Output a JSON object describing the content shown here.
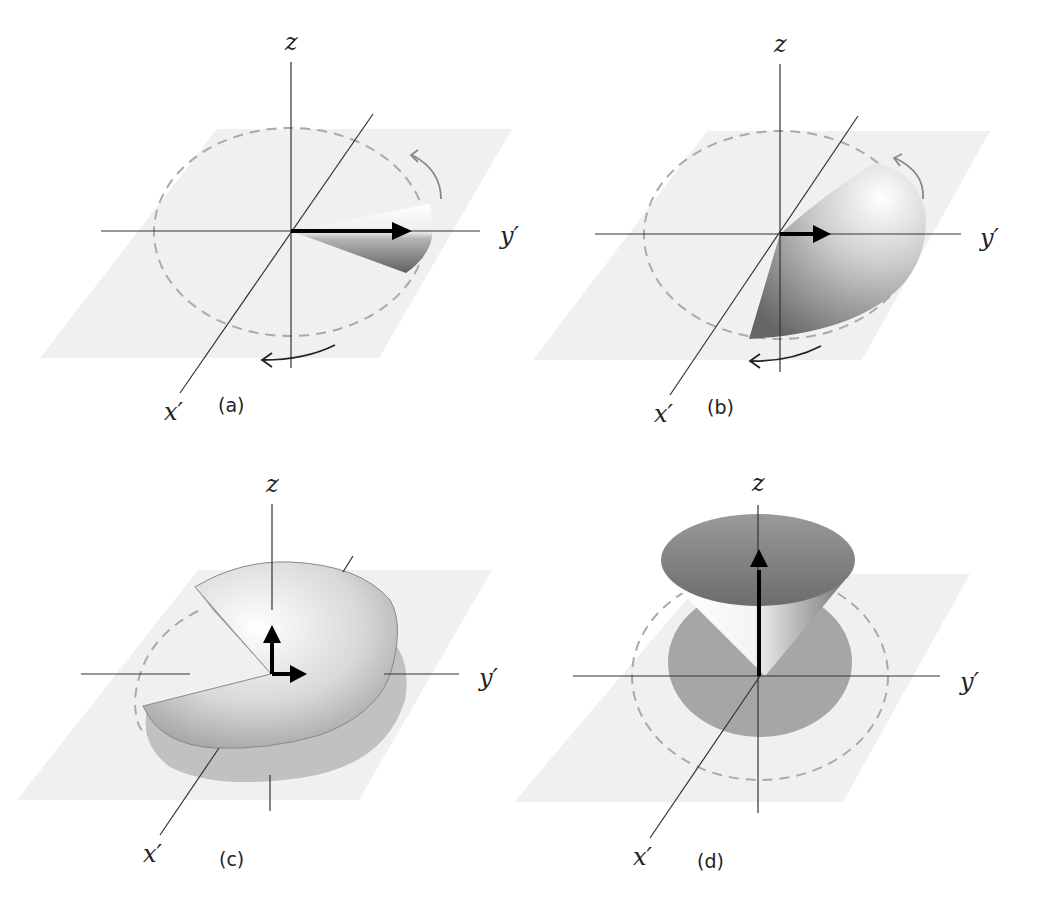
{
  "figure": {
    "colors": {
      "plane": "#f0f0f0",
      "axis": "#333333",
      "dashed_circle": "#aaaaaa",
      "vector": "#000000",
      "rotation_arrow_back": "#888888",
      "rotation_arrow_front": "#222222",
      "surface_dark": "#6e6e6e",
      "surface_light": "#ffffff"
    },
    "panels": [
      {
        "id": "a",
        "label": "(a)",
        "axes": {
          "z": "z",
          "x": "x′",
          "y": "y′"
        },
        "vector": "along y′ (in plane)",
        "shape": "thin wedge around y′",
        "rotation_arrows": true
      },
      {
        "id": "b",
        "label": "(b)",
        "axes": {
          "z": "z",
          "x": "x′",
          "y": "y′"
        },
        "vector": "short, along y′",
        "shape": "wider wedge / quarter dome",
        "rotation_arrows": true
      },
      {
        "id": "c",
        "label": "(c)",
        "axes": {
          "z": "z",
          "x": "x′",
          "y": "y′"
        },
        "vector": "two components: z and y′",
        "shape": "dome with missing wedge",
        "rotation_arrows": false
      },
      {
        "id": "d",
        "label": "(d)",
        "axes": {
          "z": "z",
          "x": "x′",
          "y": "y′"
        },
        "vector": "along z",
        "shape": "cone about z with shadow disk",
        "rotation_arrows": false
      }
    ]
  }
}
